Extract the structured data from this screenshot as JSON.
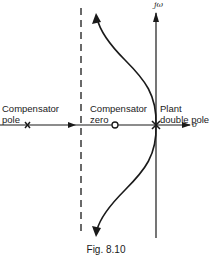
{
  "figure": {
    "caption": "Fig. 8.10",
    "type": "root-locus",
    "axes": {
      "real_label": "σ",
      "imag_label": "jω"
    },
    "labels": {
      "compensator_pole": [
        "Compensator",
        "pole"
      ],
      "compensator_zero": [
        "Compensator",
        "zero"
      ],
      "plant_double_pole": [
        "Plant",
        "double pole"
      ]
    },
    "markers": [
      {
        "kind": "pole",
        "symbol": "×",
        "name": "compensator pole"
      },
      {
        "kind": "zero",
        "symbol": "○",
        "name": "compensator zero"
      },
      {
        "kind": "double-pole",
        "symbol": "×",
        "name": "plant double pole"
      }
    ],
    "asymptote": {
      "style": "dashed",
      "orientation": "vertical"
    },
    "colors": {
      "ink": "#1a1a1a",
      "background": "#ffffff"
    }
  }
}
